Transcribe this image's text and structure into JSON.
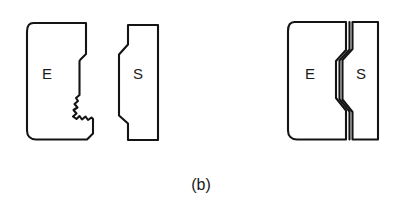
{
  "figure": {
    "caption": "(b)",
    "background_color": "#ffffff",
    "line_color": "#141414",
    "text_color": "#1a1a1a",
    "line_width": 2.1,
    "width": 404,
    "height": 213
  },
  "left_group": {
    "name": "separated-fracture-halves",
    "parts": [
      {
        "id": "left-part-e",
        "label": "E",
        "label_x": 47,
        "label_y": 75,
        "description": "left fracture half with rounded left corners, stepped notch and jagged crack edge on right",
        "outline_points": "33,23 86,23 86,54 79,61 79,96 86,103 86,114 93,114 93,133 87,139 36,139 27,131 27,31",
        "edge_profile": "jagged"
      },
      {
        "id": "left-part-s",
        "label": "S",
        "label_x": 138,
        "label_y": 75,
        "description": "right mating half with angled stepped left edge and straight right edge",
        "outline_points": "128,25 158,25 158,140 128,140 128,124 119,116 119,54 128,44",
        "edge_profile": "stepped"
      }
    ]
  },
  "right_group": {
    "name": "assembled-fracture-halves",
    "parts": [
      {
        "id": "right-part-e",
        "label": "E",
        "label_x": 310,
        "label_y": 75,
        "description": "left half of the assembled pair, rounded left corners, mated along serrated interface",
        "outline_points": "294,22 346,22 346,50 336,61 336,98 346,110 346,139 297,139 288,131 288,31",
        "edge_profile": "mated"
      },
      {
        "id": "right-part-s",
        "label": "S",
        "label_x": 360,
        "label_y": 75,
        "description": "right half of the assembled pair, interface line runs parallel to the E half edge",
        "outline_points": "352,22 378,22 378,139 352,139 352,112 342,99 342,60 352,49",
        "edge_profile": "mated"
      }
    ],
    "interface": {
      "id": "fracture-interface-line",
      "points": "349,22 349,49 339,60 339,99 349,112 349,139"
    }
  },
  "labels": {
    "e_symbol": "E",
    "s_symbol": "S"
  }
}
